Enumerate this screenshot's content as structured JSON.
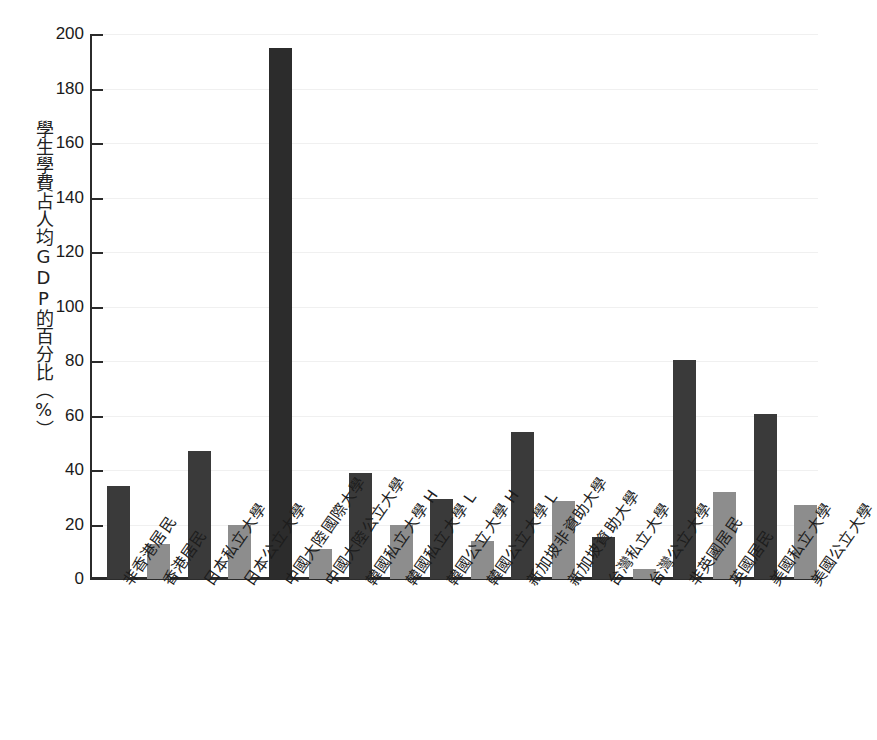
{
  "chart_data": {
    "type": "bar",
    "title": "",
    "subtitle": "",
    "xlabel": "",
    "ylabel": "學生學費占人均GDP的百分比（%）",
    "ylim": [
      0,
      200
    ],
    "ytick_step": 20,
    "yticks": [
      0,
      20,
      40,
      60,
      80,
      100,
      120,
      140,
      160,
      180,
      200
    ],
    "ytick_labels": [
      "0",
      "20",
      "40",
      "60",
      "80",
      "100",
      "120",
      "140",
      "160",
      "180",
      "200"
    ],
    "grid": true,
    "grid_axis": "y",
    "legend": "none",
    "legend_position": "none",
    "categories": [
      "非香港居民",
      "香港居民",
      "日本私立大學",
      "日本公立大學",
      "中國大陸國際大學",
      "中國大陸公立大學",
      "韓國私立大學 H",
      "韓國私立大學 L",
      "韓國公立大學 H",
      "韓國公立大學 L",
      "新加坡非資助大學",
      "新加坡資助大學",
      "台灣私立大學",
      "台灣公立大學",
      "非英國居民",
      "英國居民",
      "美國私立大學",
      "美國公立大學"
    ],
    "values": [
      34,
      13,
      47,
      20,
      195,
      11,
      39,
      20,
      29.5,
      14,
      54,
      28.5,
      15.5,
      3.5,
      80.5,
      32,
      60.5,
      27
    ],
    "bar_colors": [
      "#3a3a3a",
      "#8d8d8d",
      "#3a3a3a",
      "#8d8d8d",
      "#2c2c2c",
      "#8d8d8d",
      "#3a3a3a",
      "#8d8d8d",
      "#3a3a3a",
      "#8d8d8d",
      "#3a3a3a",
      "#8d8d8d",
      "#3a3a3a",
      "#8d8d8d",
      "#3a3a3a",
      "#8d8d8d",
      "#3a3a3a",
      "#8d8d8d"
    ],
    "colors": {
      "dark_bar": "#3a3a3a",
      "light_bar": "#8d8d8d",
      "axis": "#2b2b2b",
      "gridline": "#f0f0f0",
      "background": "#ffffff",
      "text": "#1a1a1a"
    }
  }
}
